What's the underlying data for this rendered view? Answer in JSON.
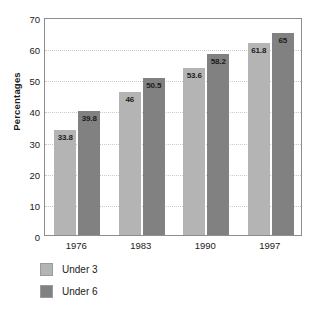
{
  "chart_data": {
    "type": "bar",
    "title": "",
    "subtitle": "",
    "xlabel": "",
    "ylabel": "Percentages",
    "categories": [
      "1976",
      "1983",
      "1990",
      "1997"
    ],
    "series": [
      {
        "name": "Under 3",
        "color": "#b4b4b4",
        "values": [
          33.8,
          46,
          53.6,
          61.8
        ],
        "labels": [
          "33.8",
          "46",
          "53.6",
          "61.8"
        ]
      },
      {
        "name": "Under 6",
        "color": "#818181",
        "values": [
          39.8,
          50.5,
          58.2,
          65
        ],
        "labels": [
          "39.8",
          "50.5",
          "58.2",
          "65"
        ]
      }
    ],
    "ylim": [
      0,
      70
    ],
    "yticks": [
      0,
      10,
      20,
      30,
      40,
      50,
      60,
      70
    ],
    "ytick_labels": [
      "0",
      "10",
      "20",
      "30",
      "40",
      "50",
      "60",
      "70"
    ],
    "grid": true,
    "grid_color": "#c9c9c9",
    "legend_position": "bottom-left",
    "frame_color": "#8d8d8d",
    "background": "#ffffff",
    "value_labels_inside_bars": true
  }
}
